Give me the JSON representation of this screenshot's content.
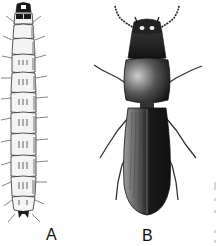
{
  "figure": {
    "panels": [
      {
        "id": "A",
        "label": "A",
        "subject": "larva",
        "view": "dorsal"
      },
      {
        "id": "B",
        "label": "B",
        "subject": "adult beetle",
        "view": "dorsal"
      }
    ],
    "colors": {
      "background": "#ffffff",
      "ink": "#111111",
      "larva_body": "#f2f2f2",
      "beetle_dark": "#1a1a1a",
      "beetle_mid": "#555555"
    }
  }
}
